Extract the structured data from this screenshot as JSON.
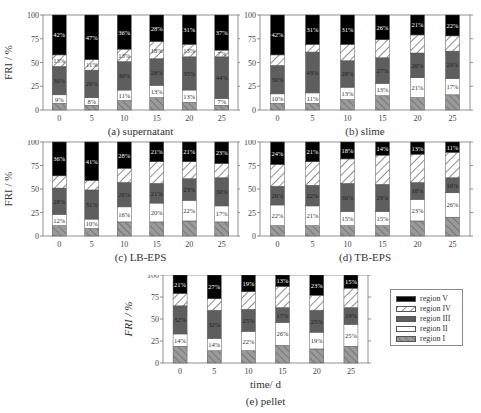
{
  "figure": {
    "y_axis_label": "FRI / %",
    "x_axis_label": "time/ d",
    "legend": [
      "region V",
      "region IV",
      "region III",
      "region II",
      "region I"
    ],
    "region_order_bottom_to_top": [
      "region I",
      "region II",
      "region III",
      "region IV",
      "region V"
    ],
    "colors": {
      "region I": "#9a9a9a",
      "region II": "#ffffff",
      "region III": "#5e5e5e",
      "region IV": "#ffffff",
      "region V": "#000000"
    }
  },
  "chart_data": [
    {
      "type": "bar",
      "stacked": true,
      "title": "(a) supernatant",
      "xlabel": "",
      "ylabel": "FRI / %",
      "ylim": [
        0,
        100
      ],
      "yticks": [
        0,
        25,
        50,
        75,
        100
      ],
      "categories": [
        "0",
        "5",
        "10",
        "15",
        "20",
        "25"
      ],
      "series": [
        {
          "name": "region I",
          "values": [
            7,
            5,
            10,
            13,
            8,
            5
          ]
        },
        {
          "name": "region II",
          "values": [
            9,
            8,
            11,
            13,
            13,
            7
          ]
        },
        {
          "name": "region III",
          "values": [
            30,
            29,
            30,
            28,
            35,
            44
          ]
        },
        {
          "name": "region IV",
          "values": [
            12,
            11,
            13,
            18,
            13,
            7
          ]
        },
        {
          "name": "region V",
          "values": [
            42,
            47,
            36,
            28,
            31,
            37
          ]
        }
      ],
      "labels": {
        "region II": [
          "9%",
          "8%",
          "11%",
          "13%",
          "13%",
          "7%"
        ],
        "region III": [
          "30%",
          "29%",
          "30%",
          "28%",
          "35%",
          "44%"
        ],
        "region IV": [
          "13%",
          "11%",
          "13%",
          "18%",
          "13%",
          "7%"
        ],
        "region V": [
          "42%",
          "47%",
          "36%",
          "28%",
          "31%",
          "37%"
        ]
      }
    },
    {
      "type": "bar",
      "stacked": true,
      "title": "(b) slime",
      "xlabel": "",
      "ylabel": "",
      "ylim": [
        0,
        100
      ],
      "yticks": [
        0,
        25,
        50,
        75,
        100
      ],
      "categories": [
        "0",
        "5",
        "10",
        "15",
        "20",
        "25"
      ],
      "series": [
        {
          "name": "region I",
          "values": [
            7,
            7,
            11,
            15,
            13,
            16
          ]
        },
        {
          "name": "region II",
          "values": [
            10,
            11,
            13,
            13,
            21,
            17
          ]
        },
        {
          "name": "region III",
          "values": [
            30,
            43,
            28,
            27,
            26,
            29
          ]
        },
        {
          "name": "region IV",
          "values": [
            11,
            8,
            17,
            19,
            19,
            16
          ]
        },
        {
          "name": "region V",
          "values": [
            42,
            31,
            31,
            26,
            21,
            22
          ]
        }
      ],
      "labels": {
        "region II": [
          "10%",
          "11%",
          "13%",
          "13%",
          "21%",
          "17%"
        ],
        "region III": [
          "30%",
          "43%",
          "28%",
          "27%",
          "26%",
          "29%"
        ],
        "region V": [
          "42%",
          "31%",
          "31%",
          "26%",
          "21%",
          "22%"
        ]
      }
    },
    {
      "type": "bar",
      "stacked": true,
      "title": "(c) LB-EPS",
      "xlabel": "",
      "ylabel": "FRI / %",
      "ylim": [
        0,
        100
      ],
      "yticks": [
        0,
        25,
        50,
        75,
        100
      ],
      "categories": [
        "0",
        "5",
        "10",
        "15",
        "20",
        "25"
      ],
      "series": [
        {
          "name": "region I",
          "values": [
            11,
            8,
            15,
            15,
            16,
            15
          ]
        },
        {
          "name": "region II",
          "values": [
            12,
            10,
            16,
            20,
            22,
            17
          ]
        },
        {
          "name": "region III",
          "values": [
            28,
            31,
            26,
            21,
            23,
            30
          ]
        },
        {
          "name": "region IV",
          "values": [
            13,
            10,
            15,
            23,
            18,
            15
          ]
        },
        {
          "name": "region V",
          "values": [
            36,
            41,
            28,
            21,
            21,
            23
          ]
        }
      ],
      "labels": {
        "region II": [
          "12%",
          "10%",
          "16%",
          "20%",
          "22%",
          "17%"
        ],
        "region III": [
          "28%",
          "31%",
          "26%",
          "21%",
          "23%",
          "30%"
        ],
        "region V": [
          "36%",
          "41%",
          "28%",
          "21%",
          "21%",
          "23%"
        ]
      }
    },
    {
      "type": "bar",
      "stacked": true,
      "title": "(d) TB-EPS",
      "xlabel": "",
      "ylabel": "",
      "ylim": [
        0,
        100
      ],
      "yticks": [
        0,
        25,
        50,
        75,
        100
      ],
      "categories": [
        "0",
        "5",
        "10",
        "15",
        "20",
        "25"
      ],
      "series": [
        {
          "name": "region I",
          "values": [
            11,
            11,
            11,
            11,
            16,
            20
          ]
        },
        {
          "name": "region II",
          "values": [
            22,
            21,
            15,
            15,
            23,
            26
          ]
        },
        {
          "name": "region III",
          "values": [
            20,
            22,
            30,
            29,
            18,
            16
          ]
        },
        {
          "name": "region IV",
          "values": [
            23,
            25,
            26,
            31,
            30,
            27
          ]
        },
        {
          "name": "region V",
          "values": [
            24,
            21,
            18,
            14,
            13,
            11
          ]
        }
      ],
      "labels": {
        "region II": [
          "22%",
          "21%",
          "15%",
          "15%",
          "23%",
          "26%"
        ],
        "region III": [
          "20%",
          "22%",
          "30%",
          "29%",
          "18%",
          "16%"
        ],
        "region V": [
          "24%",
          "21%",
          "18%",
          "14%",
          "13%",
          "11%"
        ]
      }
    },
    {
      "type": "bar",
      "stacked": true,
      "title": "(e) pellet",
      "xlabel": "time/ d",
      "ylabel": "FRI / %",
      "ylim": [
        0,
        100
      ],
      "yticks": [
        0,
        25,
        50,
        75,
        100
      ],
      "categories": [
        "0",
        "5",
        "10",
        "15",
        "20",
        "25"
      ],
      "series": [
        {
          "name": "region I",
          "values": [
            19,
            14,
            14,
            20,
            16,
            19
          ]
        },
        {
          "name": "region II",
          "values": [
            14,
            14,
            22,
            26,
            19,
            25
          ]
        },
        {
          "name": "region III",
          "values": [
            32,
            32,
            25,
            17,
            25,
            19
          ]
        },
        {
          "name": "region IV",
          "values": [
            14,
            13,
            20,
            24,
            17,
            22
          ]
        },
        {
          "name": "region V",
          "values": [
            21,
            27,
            19,
            13,
            23,
            15
          ]
        }
      ],
      "labels": {
        "region II": [
          "14%",
          "14%",
          "22%",
          "26%",
          "19%",
          "25%"
        ],
        "region III": [
          "32%",
          "32%",
          "25%",
          "17%",
          "25%",
          "19%"
        ],
        "region V": [
          "21%",
          "27%",
          "19%",
          "13%",
          "23%",
          "15%"
        ]
      }
    }
  ]
}
